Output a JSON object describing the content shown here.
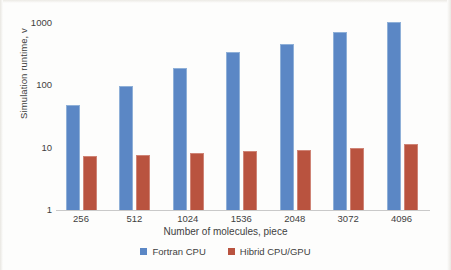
{
  "chart_data": {
    "type": "bar",
    "title": "",
    "xlabel": "Number of molecules, piece",
    "ylabel": "Simulation runtime, v",
    "yscale": "log",
    "ylim": [
      1,
      1000
    ],
    "ytick_labels": [
      "1000",
      "100",
      "10",
      "1"
    ],
    "ytick_values": [
      1000,
      100,
      10,
      1
    ],
    "grid": false,
    "legend_position": "bottom",
    "categories": [
      "256",
      "512",
      "1024",
      "1536",
      "2048",
      "3072",
      "4096"
    ],
    "series": [
      {
        "name": "Fortran CPU",
        "color": "#5b87c5",
        "values": [
          46,
          93,
          180,
          320,
          440,
          670,
          1000
        ]
      },
      {
        "name": "Hibrid CPU/GPU",
        "color": "#b9533f",
        "values": [
          7.0,
          7.3,
          7.8,
          8.4,
          8.8,
          9.6,
          10.8
        ]
      }
    ]
  }
}
